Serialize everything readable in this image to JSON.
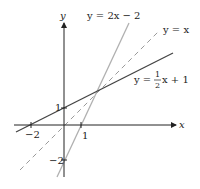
{
  "diagram": {
    "axes": {
      "x_label": "x",
      "y_label": "y",
      "x_ticks": [
        {
          "value": -2,
          "label": "−2"
        },
        {
          "value": 1,
          "label": "1"
        }
      ],
      "y_ticks": [
        {
          "value": 1,
          "label": "1"
        },
        {
          "value": -2,
          "label": "−2"
        }
      ]
    },
    "lines": [
      {
        "name": "steep",
        "equation": "y = 2x − 2",
        "slope": 2,
        "intercept": -2,
        "style": "solid",
        "color": "#aaaaaa"
      },
      {
        "name": "identity",
        "equation": "y = x",
        "slope": 1,
        "intercept": 0,
        "style": "dashed",
        "color": "#999999"
      },
      {
        "name": "shallow",
        "equation_prefix": "y =",
        "equation_frac_num": "1",
        "equation_frac_den": "2",
        "equation_suffix": "x + 1",
        "slope": 0.5,
        "intercept": 1,
        "style": "solid",
        "color": "#444444"
      }
    ],
    "intersection": {
      "x": 2,
      "y": 2
    }
  },
  "labels": {
    "y_axis": "y",
    "x_axis": "x",
    "steep_eq": "y = 2x − 2",
    "identity_eq": "y = x",
    "shallow_prefix": "y =",
    "shallow_num": "1",
    "shallow_den": "2",
    "shallow_suffix": "x + 1",
    "tick_x_neg2": "−2",
    "tick_x_1": "1",
    "tick_y_1": "1",
    "tick_y_neg2": "−2"
  }
}
